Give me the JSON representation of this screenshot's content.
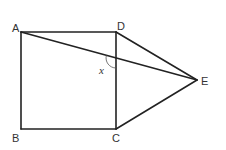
{
  "diagram": {
    "type": "geometry",
    "points": {
      "A": {
        "label": "A",
        "x": 21,
        "y": 32
      },
      "B": {
        "label": "B",
        "x": 21,
        "y": 129
      },
      "C": {
        "label": "C",
        "x": 116,
        "y": 129
      },
      "D": {
        "label": "D",
        "x": 116,
        "y": 32
      },
      "E": {
        "label": "E",
        "x": 197,
        "y": 80
      }
    },
    "segments": [
      "AB",
      "BC",
      "CD",
      "DA",
      "DE",
      "CE",
      "AE"
    ],
    "angle": {
      "label": "x",
      "at": "intersection of AE and DC"
    },
    "stroke_color": "#222222"
  }
}
